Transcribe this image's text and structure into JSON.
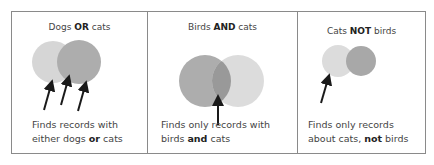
{
  "panels": [
    {
      "id": "or",
      "title": {
        "pre": "Dogs ",
        "op": "OR",
        "post": " cats"
      },
      "caption": {
        "line1": "Finds records with",
        "line2_pre": "either dogs ",
        "line2_op": "or",
        "line2_post": " cats"
      },
      "circles": [
        {
          "label": "dogs",
          "fill": "#d6d6d6"
        },
        {
          "label": "cats",
          "fill": "#adadad"
        }
      ],
      "arrows": 3
    },
    {
      "id": "and",
      "title": {
        "pre": "Birds ",
        "op": "AND",
        "post": " cats"
      },
      "caption": {
        "line1": "Finds only records with",
        "line2_pre": "birds ",
        "line2_op": "and",
        "line2_post": " cats"
      },
      "circles": [
        {
          "label": "birds",
          "fill": "#adadad"
        },
        {
          "label": "cats",
          "fill": "#dcdcdc"
        }
      ],
      "overlap_fill": "#999999",
      "arrows": 1
    },
    {
      "id": "not",
      "title": {
        "pre": "Cats ",
        "op": "NOT",
        "post": " birds"
      },
      "caption": {
        "line1": "Finds only records",
        "line2_pre": "about cats, ",
        "line2_op": "not",
        "line2_post": " birds"
      },
      "circles": [
        {
          "label": "cats",
          "fill": "#dcdcdc"
        },
        {
          "label": "birds",
          "fill": "#a8a8a8"
        }
      ],
      "arrows": 1
    }
  ],
  "colors": {
    "border": "#8a8a8a",
    "arrow": "#1a1a1a"
  }
}
